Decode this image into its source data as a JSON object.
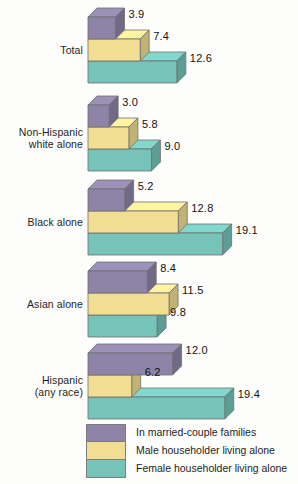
{
  "chart_data": {
    "type": "bar",
    "orientation": "horizontal",
    "style": "3d-stacked-rows",
    "title": "",
    "subtitle": "",
    "xlabel": "",
    "ylabel": "",
    "grid": false,
    "legend_position": "bottom",
    "xlim": [
      0,
      19.4
    ],
    "categories": [
      "Total",
      "Non-Hispanic white alone",
      "Black alone",
      "Asian alone",
      "Hispanic (any race)"
    ],
    "category_label_lines": [
      [
        "Total"
      ],
      [
        "Non-Hispanic",
        "white alone"
      ],
      [
        "Black alone"
      ],
      [
        "Asian alone"
      ],
      [
        "Hispanic",
        "(any race)"
      ]
    ],
    "series": [
      {
        "name": "In married-couple families",
        "color": "#8d84a8",
        "values": [
          3.9,
          3.0,
          5.2,
          8.4,
          12.0
        ],
        "labels": [
          "3.9",
          "3.0",
          "5.2",
          "8.4",
          "12.0"
        ]
      },
      {
        "name": "Male householder living alone",
        "color": "#f1de92",
        "values": [
          7.4,
          5.8,
          12.8,
          11.5,
          6.2
        ],
        "labels": [
          "7.4",
          "5.8",
          "12.8",
          "11.5",
          "6.2"
        ]
      },
      {
        "name": "Female householder living alone",
        "color": "#76c4b9",
        "values": [
          12.6,
          9.0,
          19.1,
          9.8,
          19.4
        ],
        "labels": [
          "12.6",
          "9.0",
          "19.1",
          "9.8",
          "19.4"
        ]
      }
    ]
  },
  "legend": {
    "items": [
      {
        "label": "In married-couple families",
        "color": "#8d84a8"
      },
      {
        "label": "Male householder living alone",
        "color": "#f1de92"
      },
      {
        "label": "Female householder living alone",
        "color": "#76c4b9"
      }
    ]
  },
  "colors": {
    "series_purple": "#8d84a8",
    "series_yellow": "#f1de92",
    "series_teal": "#76c4b9",
    "background": "#fdfdfb",
    "text": "#1d1d1d",
    "bar_outline": "#6f6f6f"
  }
}
